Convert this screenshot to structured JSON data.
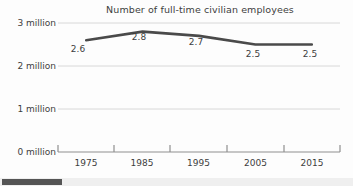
{
  "chart_data": {
    "type": "line",
    "title": "Number of full-time civilian employees",
    "xlabel": "",
    "ylabel": "",
    "categories": [
      "1975",
      "1985",
      "1995",
      "2005",
      "2015"
    ],
    "values": [
      2.6,
      2.8,
      2.7,
      2.5,
      2.5
    ],
    "point_labels": [
      "2.6",
      "2.8",
      "2.7",
      "2.5",
      "2.5"
    ],
    "ylim": [
      0,
      3
    ],
    "yticks": [
      0,
      1,
      2,
      3
    ],
    "ytick_labels": [
      "0 million",
      "1 million",
      "2 million",
      "3 million"
    ],
    "grid": true,
    "legend": "none",
    "series": [
      {
        "name": "Full-time civilian employees",
        "values": [
          2.6,
          2.8,
          2.7,
          2.5,
          2.5
        ],
        "color": "#4a4a4a"
      }
    ]
  },
  "axis": {
    "y_labels": [
      {
        "text": "3 million",
        "value": 3
      },
      {
        "text": "2 million",
        "value": 2
      },
      {
        "text": "1 million",
        "value": 1
      },
      {
        "text": "0 million",
        "value": 0
      }
    ],
    "x_labels": [
      "1975",
      "1985",
      "1995",
      "2005",
      "2015"
    ]
  },
  "colors": {
    "line": "#4a4a4a",
    "grid": "#d8d8d8",
    "axis": "#9a9a9a",
    "text": "#3d3d3d",
    "background": "#fdfdfd",
    "scrollbar_thumb": "#555555",
    "scrollbar_track": "#efefef"
  },
  "scrollbar": {
    "thumb_label": "horizontal-scroll-thumb",
    "track_label": "horizontal-scroll-track"
  }
}
